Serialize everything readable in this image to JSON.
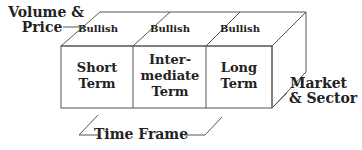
{
  "diagram": {
    "dimensions": {
      "top_axis": "Volume & Price",
      "top_axis_lines": [
        "Volume &",
        "Price"
      ],
      "side_axis": "Market & Sector",
      "side_axis_lines": [
        "Market",
        "& Sector"
      ],
      "bottom_axis": "Time Frame"
    },
    "top_cells": [
      "Bullish",
      "Bullish",
      "Bullish"
    ],
    "front_cells": [
      {
        "lines": [
          "Short",
          "Term"
        ]
      },
      {
        "lines": [
          "Inter-",
          "mediate",
          "Term"
        ]
      },
      {
        "lines": [
          "Long",
          "Term"
        ]
      }
    ],
    "colors": {
      "line": "#555555",
      "text": "#222222",
      "background": "#ffffff"
    }
  }
}
